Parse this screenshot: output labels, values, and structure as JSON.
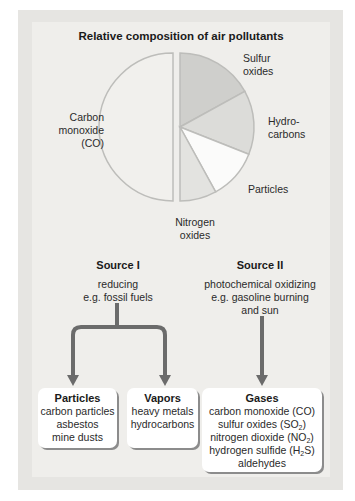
{
  "chart_data": {
    "type": "pie",
    "title": "Relative composition of air pollutants",
    "categories": [
      "Carbon monoxide (CO)",
      "Sulfur oxides",
      "Hydrocarbons",
      "Particles",
      "Nitrogen oxides"
    ],
    "values": [
      50,
      17,
      14,
      11,
      8
    ],
    "unit": "approximate percent (no values labeled in figure)",
    "colors": [
      "#f1f0ed",
      "#cfcfcc",
      "#dcdcd9",
      "#fbfbfa",
      "#e3e3e0"
    ],
    "legend": "none (labels placed beside slices)"
  },
  "pie_labels": {
    "co_line1": "Carbon",
    "co_line2": "monoxide",
    "co_line3": "(CO)",
    "sulfur_line1": "Sulfur",
    "sulfur_line2": "oxides",
    "hydro_line1": "Hydro-",
    "hydro_line2": "carbons",
    "particles": "Particles",
    "nitrogen_line1": "Nitrogen",
    "nitrogen_line2": "oxides"
  },
  "sources": [
    {
      "title": "Source I",
      "lines": [
        "reducing",
        "e.g. fossil fuels"
      ]
    },
    {
      "title": "Source II",
      "lines": [
        "photochemical oxidizing",
        "e.g. gasoline burning",
        "and sun"
      ]
    }
  ],
  "boxes": [
    {
      "title": "Particles",
      "items": [
        "carbon particles",
        "asbestos",
        "mine dusts"
      ]
    },
    {
      "title": "Vapors",
      "items": [
        "heavy metals",
        "hydrocarbons"
      ]
    },
    {
      "title": "Gases",
      "items": [
        {
          "pre": "carbon monoxide (CO)"
        },
        {
          "pre": "sulfur oxides (SO",
          "sub": "2",
          "post": ")"
        },
        {
          "pre": "nitrogen dioxide (NO",
          "sub": "2",
          "post": ")"
        },
        {
          "pre": "hydrogen sulfide (H",
          "sub": "2",
          "post": "S)"
        },
        {
          "pre": "aldehydes"
        }
      ]
    }
  ],
  "colors": {
    "arrow": "#6b6b6b",
    "frame": "#e6e5e2",
    "panel": "#efeeeb"
  }
}
